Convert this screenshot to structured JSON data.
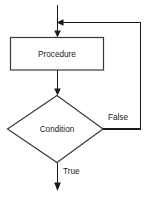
{
  "diagram": {
    "type": "flowchart",
    "nodes": [
      {
        "id": "procedure",
        "shape": "rectangle",
        "label": "Procedure"
      },
      {
        "id": "condition",
        "shape": "diamond",
        "label": "Condition"
      }
    ],
    "edge_labels": {
      "false_branch": "False",
      "true_branch": "True"
    },
    "colors": {
      "background": "#ffffff",
      "line": "#1a1a1a",
      "shape_stroke": "#3a3a3a",
      "shape_fill": "#ffffff",
      "text": "#1a1a1a"
    }
  }
}
